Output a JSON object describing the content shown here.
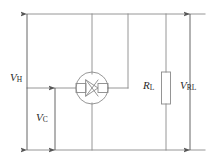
{
  "diagram": {
    "type": "circuit-schematic",
    "stroke_color": "#8a8a8a",
    "label_color": "#2a2a2a",
    "background_color": "#ffffff",
    "labels": {
      "v_h": {
        "symbol": "V",
        "subscript": "H"
      },
      "v_c": {
        "symbol": "V",
        "subscript": "C"
      },
      "r_l": {
        "symbol": "R",
        "subscript": "L"
      },
      "v_rl": {
        "symbol": "V",
        "subscript": "RL"
      }
    },
    "components": {
      "hall_element": "hall-element-circle",
      "load_resistor": "resistor-box"
    }
  }
}
